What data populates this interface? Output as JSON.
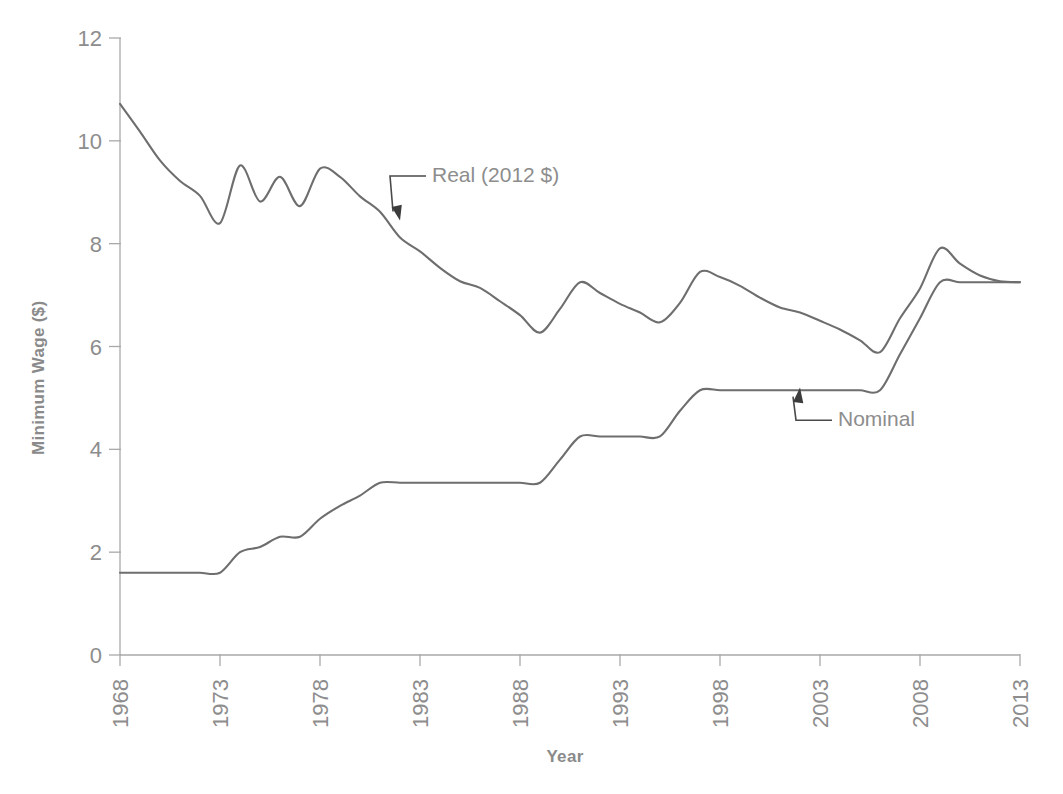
{
  "chart_data": {
    "type": "line",
    "title": "",
    "xlabel": "Year",
    "ylabel": "Minimum Wage ($)",
    "xlim": [
      1968,
      2013
    ],
    "ylim": [
      0,
      12
    ],
    "xticks": [
      1968,
      1973,
      1978,
      1983,
      1988,
      1993,
      1998,
      2003,
      2008,
      2013
    ],
    "xticklabels": [
      "1968",
      "1973",
      "1978",
      "1983",
      "1988",
      "1993",
      "1998",
      "2003",
      "2008",
      "2013"
    ],
    "yticks": [
      0,
      2,
      4,
      6,
      8,
      10,
      12
    ],
    "yticklabels": [
      "0",
      "2",
      "4",
      "6",
      "8",
      "10",
      "12"
    ],
    "grid": false,
    "legend_position": "inline-annotations",
    "line_color": "#6e6e6e",
    "axis_color": "#a9a9a9",
    "text_color": "#8d8d8d",
    "annotations": [
      {
        "name": "real-series-label",
        "text": "Real (2012 $)",
        "label_x": 1983.3,
        "label_y": 9.2,
        "points_to_x": 1982.0,
        "points_to_y": 8.45
      },
      {
        "name": "nominal-series-label",
        "text": "Nominal",
        "label_x": 2003.6,
        "label_y": 4.45,
        "points_to_x": 2002.0,
        "points_to_y": 5.2
      }
    ],
    "x": [
      1968,
      1969,
      1970,
      1971,
      1972,
      1973,
      1974,
      1975,
      1976,
      1977,
      1978,
      1979,
      1980,
      1981,
      1982,
      1983,
      1984,
      1985,
      1986,
      1987,
      1988,
      1989,
      1990,
      1991,
      1992,
      1993,
      1994,
      1995,
      1996,
      1997,
      1998,
      1999,
      2000,
      2001,
      2002,
      2003,
      2004,
      2005,
      2006,
      2007,
      2008,
      2009,
      2010,
      2011,
      2012,
      2013
    ],
    "series": [
      {
        "name": "Real (2012 $)",
        "label": "Real (2012 $)",
        "color": "#6e6e6e",
        "values": [
          10.72,
          10.18,
          9.62,
          9.22,
          8.93,
          8.4,
          9.52,
          8.82,
          9.3,
          8.73,
          9.46,
          9.3,
          8.92,
          8.62,
          8.12,
          7.85,
          7.53,
          7.27,
          7.14,
          6.88,
          6.61,
          6.27,
          6.73,
          7.25,
          7.04,
          6.83,
          6.66,
          6.47,
          6.85,
          7.45,
          7.35,
          7.18,
          6.95,
          6.76,
          6.66,
          6.5,
          6.33,
          6.12,
          5.89,
          6.55,
          7.13,
          7.91,
          7.61,
          7.38,
          7.27,
          7.25
        ]
      },
      {
        "name": "Nominal",
        "label": "Nominal",
        "color": "#6e6e6e",
        "values": [
          1.6,
          1.6,
          1.6,
          1.6,
          1.6,
          1.6,
          2.0,
          2.1,
          2.3,
          2.3,
          2.65,
          2.9,
          3.1,
          3.35,
          3.35,
          3.35,
          3.35,
          3.35,
          3.35,
          3.35,
          3.35,
          3.35,
          3.8,
          4.25,
          4.25,
          4.25,
          4.25,
          4.25,
          4.75,
          5.15,
          5.15,
          5.15,
          5.15,
          5.15,
          5.15,
          5.15,
          5.15,
          5.15,
          5.15,
          5.85,
          6.55,
          7.25,
          7.25,
          7.25,
          7.25,
          7.25
        ]
      }
    ]
  }
}
